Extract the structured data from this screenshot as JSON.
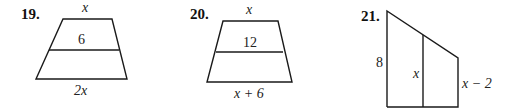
{
  "problems": [
    {
      "number": "19.",
      "shape": "trapezoid with midsegment",
      "top_label": "x",
      "midsegment_label": "6",
      "bottom_label": "2x"
    },
    {
      "number": "20.",
      "shape": "trapezoid with midsegment",
      "top_label": "x",
      "midsegment_label": "12",
      "bottom_label": "x + 6"
    },
    {
      "number": "21.",
      "shape": "right trapezoid with midsegment",
      "left_label": "8",
      "middle_label": "x",
      "right_label": "x − 2"
    }
  ],
  "colors": {
    "stroke": "#1a1a1a",
    "background": "#ffffff"
  }
}
